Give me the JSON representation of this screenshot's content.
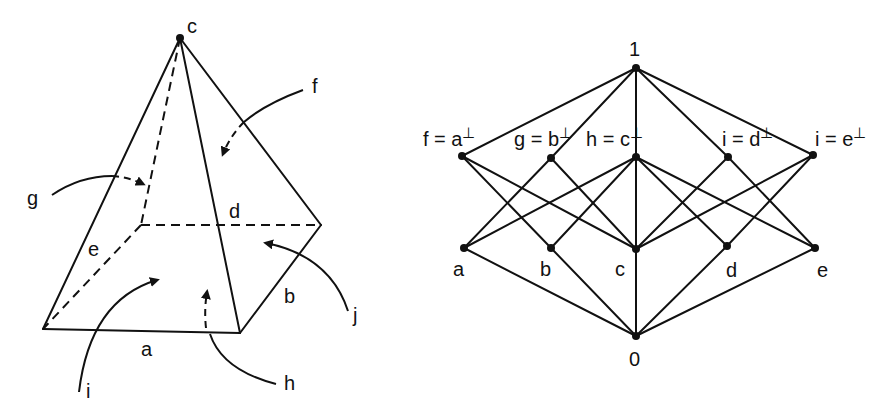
{
  "pyramid": {
    "apex_label": "c",
    "edge_labels": {
      "a": "a",
      "b": "b",
      "d": "d",
      "e": "e"
    },
    "face_labels": {
      "f": "f",
      "g": "g",
      "h": "h",
      "i": "i",
      "j": "j"
    }
  },
  "lattice": {
    "top": "1",
    "bottom": "0",
    "upper_row": [
      {
        "id": "f",
        "label": "f = a",
        "sup": "⊥"
      },
      {
        "id": "g",
        "label": "g = b",
        "sup": "⊥"
      },
      {
        "id": "h",
        "label": "h = c",
        "sup": "⊥"
      },
      {
        "id": "id",
        "label": "i = d",
        "sup": "⊥"
      },
      {
        "id": "ie",
        "label": "i = e",
        "sup": "⊥"
      }
    ],
    "lower_row": [
      {
        "id": "a",
        "label": "a"
      },
      {
        "id": "b",
        "label": "b"
      },
      {
        "id": "c",
        "label": "c"
      },
      {
        "id": "d",
        "label": "d"
      },
      {
        "id": "e",
        "label": "e"
      }
    ],
    "edges": [
      [
        "1",
        "f"
      ],
      [
        "1",
        "g"
      ],
      [
        "1",
        "h"
      ],
      [
        "1",
        "id"
      ],
      [
        "1",
        "ie"
      ],
      [
        "f",
        "b"
      ],
      [
        "f",
        "c"
      ],
      [
        "g",
        "a"
      ],
      [
        "g",
        "c"
      ],
      [
        "h",
        "a"
      ],
      [
        "h",
        "b"
      ],
      [
        "h",
        "d"
      ],
      [
        "h",
        "e"
      ],
      [
        "h",
        "c"
      ],
      [
        "id",
        "c"
      ],
      [
        "id",
        "e"
      ],
      [
        "ie",
        "c"
      ],
      [
        "ie",
        "d"
      ],
      [
        "a",
        "0"
      ],
      [
        "b",
        "0"
      ],
      [
        "c",
        "0"
      ],
      [
        "d",
        "0"
      ],
      [
        "e",
        "0"
      ]
    ]
  }
}
